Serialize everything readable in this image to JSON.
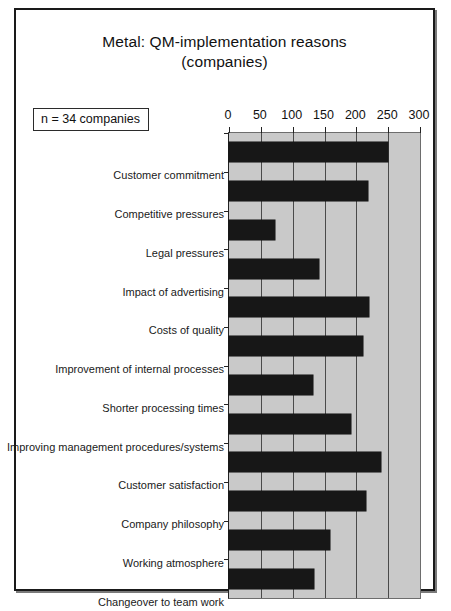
{
  "chart_data": {
    "type": "bar",
    "orientation": "horizontal",
    "title": "Metal: QM-implementation reasons (companies)",
    "title_line1": "Metal: QM-implementation reasons",
    "title_line2": "(companies)",
    "annotation": "n = 34 companies",
    "xlabel": "",
    "ylabel": "",
    "xlim": [
      0,
      300
    ],
    "xticks": [
      0,
      50,
      100,
      150,
      200,
      250,
      300
    ],
    "xtick_labels": [
      "0",
      "50",
      "100",
      "150",
      "200",
      "250",
      "300"
    ],
    "grid": true,
    "legend": "none",
    "plot_background": "#c9c9c9",
    "bar_color": "#171717",
    "categories": [
      "Customer commitment",
      "Competitive pressures",
      "Legal pressures",
      "Impact of advertising",
      "Costs of quality",
      "Improvement of internal processes",
      "Shorter processing times",
      "Improving management procedures/systems",
      "Customer satisfaction",
      "Company philosophy",
      "Working atmosphere",
      "Changeover to team work"
    ],
    "values": [
      250,
      218,
      72,
      141,
      220,
      210,
      132,
      192,
      239,
      215,
      159,
      133
    ]
  }
}
